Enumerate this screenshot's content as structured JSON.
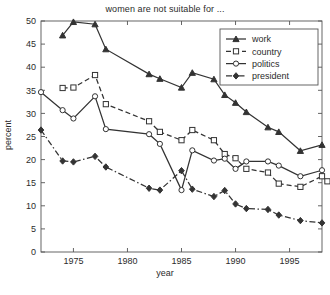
{
  "chart_data": {
    "type": "line",
    "title": "women are not suitable for ...",
    "xlabel": "year",
    "ylabel": "percent",
    "xlim": [
      1972,
      1998
    ],
    "ylim": [
      0,
      50
    ],
    "xticks": [
      1975,
      1980,
      1985,
      1990,
      1995
    ],
    "yticks": [
      0,
      5,
      10,
      15,
      20,
      25,
      30,
      35,
      40,
      45,
      50
    ],
    "grid": false,
    "legend_position": "top-right",
    "series": [
      {
        "name": "work",
        "marker": "triangle",
        "linestyle": "solid",
        "color": "#333333",
        "points": [
          [
            1974,
            46.9
          ],
          [
            1975,
            49.8
          ],
          [
            1977,
            49.3
          ],
          [
            1978,
            43.9
          ],
          [
            1982,
            38.5
          ],
          [
            1983,
            37.5
          ],
          [
            1985,
            35.6
          ],
          [
            1986,
            38.8
          ],
          [
            1988,
            37.4
          ],
          [
            1989,
            34.0
          ],
          [
            1990,
            32.3
          ],
          [
            1991,
            30.3
          ],
          [
            1993,
            27.0
          ],
          [
            1994,
            26.0
          ],
          [
            1996,
            21.9
          ],
          [
            1998,
            23.2
          ]
        ]
      },
      {
        "name": "country",
        "marker": "square",
        "linestyle": "dashed",
        "color": "#333333",
        "points": [
          [
            1974,
            35.5
          ],
          [
            1975,
            35.6
          ],
          [
            1977,
            38.3
          ],
          [
            1978,
            32.0
          ],
          [
            1982,
            28.3
          ],
          [
            1983,
            26.0
          ],
          [
            1985,
            24.2
          ],
          [
            1986,
            26.4
          ],
          [
            1988,
            24.2
          ],
          [
            1989,
            21.2
          ],
          [
            1990,
            20.3
          ],
          [
            1991,
            18.0
          ],
          [
            1993,
            17.2
          ],
          [
            1994,
            14.8
          ],
          [
            1996,
            14.1
          ],
          [
            1998,
            16.4
          ],
          [
            1998.5,
            15.3
          ]
        ]
      },
      {
        "name": "politics",
        "marker": "circle",
        "linestyle": "solid",
        "color": "#333333",
        "points": [
          [
            1972,
            34.6
          ],
          [
            1974,
            30.7
          ],
          [
            1975,
            28.9
          ],
          [
            1977,
            33.7
          ],
          [
            1978,
            26.6
          ],
          [
            1982,
            25.5
          ],
          [
            1983,
            23.4
          ],
          [
            1985,
            13.4
          ],
          [
            1986,
            22.0
          ],
          [
            1988,
            19.8
          ],
          [
            1989,
            20.2
          ],
          [
            1990,
            18.0
          ],
          [
            1991,
            19.6
          ],
          [
            1993,
            19.6
          ],
          [
            1994,
            18.7
          ],
          [
            1996,
            16.4
          ],
          [
            1998,
            17.7
          ]
        ]
      },
      {
        "name": "president",
        "marker": "diamond",
        "linestyle": "dashdot",
        "color": "#333333",
        "points": [
          [
            1972,
            26.4
          ],
          [
            1974,
            19.7
          ],
          [
            1975,
            19.5
          ],
          [
            1977,
            20.7
          ],
          [
            1978,
            18.4
          ],
          [
            1982,
            13.8
          ],
          [
            1983,
            13.4
          ],
          [
            1985,
            17.6
          ],
          [
            1986,
            13.6
          ],
          [
            1988,
            12.0
          ],
          [
            1989,
            13.3
          ],
          [
            1990,
            10.4
          ],
          [
            1991,
            9.4
          ],
          [
            1993,
            9.2
          ],
          [
            1994,
            8.0
          ],
          [
            1996,
            6.8
          ],
          [
            1998,
            6.3
          ]
        ]
      }
    ]
  },
  "legend": {
    "items": [
      {
        "label": "work"
      },
      {
        "label": "country"
      },
      {
        "label": "politics"
      },
      {
        "label": "president"
      }
    ]
  }
}
